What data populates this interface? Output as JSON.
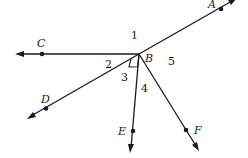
{
  "diagram": {
    "type": "geometry-angles",
    "vertex": {
      "label": "B",
      "x": 139,
      "y": 54
    },
    "rays": [
      {
        "id": "BA",
        "point_label": "A",
        "end": [
          236,
          -1
        ],
        "point": [
          221,
          9
        ],
        "label_pos": [
          211,
          6
        ]
      },
      {
        "id": "BC",
        "point_label": "C",
        "end": [
          16,
          54
        ],
        "point": [
          42,
          54
        ],
        "label_pos": [
          37,
          46
        ]
      },
      {
        "id": "BD",
        "point_label": "D",
        "end": [
          27,
          119
        ],
        "point": [
          46,
          109
        ],
        "label_pos": [
          41,
          103
        ]
      },
      {
        "id": "BE",
        "point_label": "E",
        "end": [
          131,
          152
        ],
        "point": [
          133,
          131
        ],
        "label_pos": [
          118,
          135
        ]
      },
      {
        "id": "BF",
        "point_label": "F",
        "end": [
          198,
          150
        ],
        "point": [
          186,
          130
        ],
        "label_pos": [
          195,
          135
        ]
      }
    ],
    "angle_labels": [
      {
        "text": "1",
        "x": 131,
        "y": 39
      },
      {
        "text": "2",
        "x": 105,
        "y": 68
      },
      {
        "text": "3",
        "x": 120,
        "y": 81
      },
      {
        "text": "4",
        "x": 141,
        "y": 92
      },
      {
        "text": "5",
        "x": 168,
        "y": 65
      }
    ],
    "right_angle_between": [
      "BD",
      "BE"
    ],
    "colors": {
      "ink": "#1a1a1a",
      "background": "#ffffff"
    }
  },
  "labels": {
    "A": "A",
    "B": "B",
    "C": "C",
    "D": "D",
    "E": "E",
    "F": "F",
    "a1": "1",
    "a2": "2",
    "a3": "3",
    "a4": "4",
    "a5": "5"
  }
}
